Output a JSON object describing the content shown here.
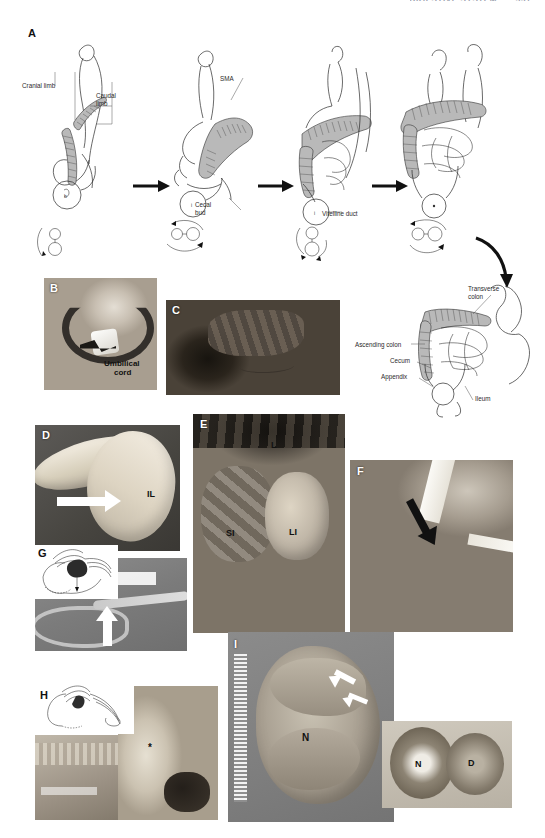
{
  "header": {
    "title": "DIGESTIVE SYSTEM",
    "page": "331"
  },
  "figure": {
    "panels": [
      {
        "id": "A",
        "letter": "A",
        "kind": "line-diagram",
        "description": "Four-stage sequence of midgut rotation with cross-section rotation keys"
      },
      {
        "id": "B",
        "letter": "B",
        "kind": "clinical-photo"
      },
      {
        "id": "C",
        "letter": "C",
        "kind": "clinical-photo"
      },
      {
        "id": "D",
        "letter": "D",
        "kind": "specimen-photo"
      },
      {
        "id": "E",
        "letter": "E",
        "kind": "operative-photo"
      },
      {
        "id": "F",
        "letter": "F",
        "kind": "operative-photo"
      },
      {
        "id": "G",
        "letter": "G",
        "kind": "radiograph"
      },
      {
        "id": "H",
        "letter": "H",
        "kind": "specimen-photo"
      },
      {
        "id": "I",
        "letter": "I",
        "kind": "specimen-photo"
      }
    ]
  },
  "panelA": {
    "letter": "A",
    "labels": {
      "cranial_limb": "Cranial limb",
      "caudal_limb_l1": "Caudal",
      "caudal_limb_l2": "limb",
      "sma": "SMA",
      "cecal_bud_l1": "Cecal",
      "cecal_bud_l2": "bud",
      "vitelline_duct": "Vitelline duct"
    }
  },
  "panelFinal": {
    "labels": {
      "transverse_colon_l1": "Transverse",
      "transverse_colon_l2": "colon",
      "ascending_colon": "Ascending colon",
      "cecum": "Cecum",
      "appendix": "Appendix",
      "ileum": "Ileum"
    }
  },
  "panelB": {
    "letter": "B",
    "labels": {
      "umbilical_l1": "Umbilical",
      "umbilical_l2": "cord"
    }
  },
  "panelC": {
    "letter": "C"
  },
  "panelD": {
    "letter": "D",
    "labels": {
      "il": "IL"
    }
  },
  "panelE": {
    "letter": "E",
    "labels": {
      "liver": "L",
      "small_intestine": "SI",
      "large_intestine": "LI"
    }
  },
  "panelF": {
    "letter": "F"
  },
  "panelG": {
    "letter": "G"
  },
  "panelH": {
    "letter": "H",
    "labels": {
      "asterisk": "*"
    }
  },
  "panelI": {
    "letter": "I",
    "labels": {
      "n_main": "N",
      "n_inset": "N",
      "d_inset": "D"
    }
  },
  "colors": {
    "page_background": "#ffffff",
    "ink": "#2a2a2a",
    "photo_mid_gray": "#8b8b8b",
    "header_gray": "#9aa0ad"
  }
}
